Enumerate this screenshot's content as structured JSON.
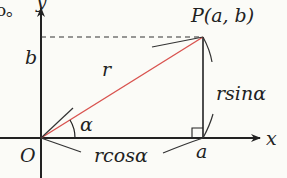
{
  "diagram": {
    "leading_text": "o。",
    "axes": {
      "x_label": "x",
      "y_label": "y",
      "origin_label": "O"
    },
    "point": {
      "label": "P(a,  b)",
      "name": "P",
      "coords": "(a,  b)"
    },
    "segments": {
      "radius_label": "r",
      "vertical_label": "rsinα",
      "horizontal_label": "rcosα"
    },
    "ticks": {
      "x_tick": "a",
      "y_tick": "b"
    },
    "angle_label": "α",
    "colors": {
      "radius": "#d9534f",
      "axes": "#222222",
      "background": "#fbfbf7"
    }
  }
}
